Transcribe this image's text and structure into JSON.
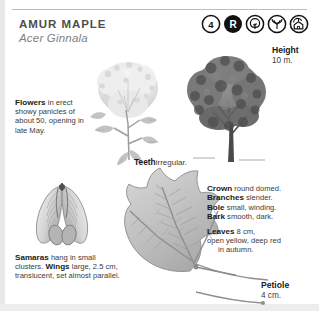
{
  "header": {
    "common_name": "AMUR MAPLE",
    "scientific_name": "Acer Ginnala"
  },
  "badges": [
    {
      "name": "zone-number-badge",
      "label": "4",
      "style": "outline"
    },
    {
      "name": "rounded-form-badge",
      "label": "R",
      "style": "solid"
    },
    {
      "name": "round-tree-icon",
      "label": "",
      "style": "outline"
    },
    {
      "name": "vase-tree-icon",
      "label": "",
      "style": "outline"
    },
    {
      "name": "tree-with-house-icon",
      "label": "",
      "style": "outline"
    }
  ],
  "callouts": {
    "height": {
      "title": "Height",
      "value": "10 m."
    },
    "teeth": {
      "title": "Teeth",
      "value": "irregular."
    },
    "petiole": {
      "title": "Petiole",
      "value": "4 cm."
    }
  },
  "flowers": {
    "title": "Flowers",
    "text": " in erect showy panicles of about 50, opening in late May."
  },
  "samaras": {
    "title": "Samaras",
    "text": " hang in small clusters.",
    "wings_title": "Wings",
    "wings_text": " large, 2.5 cm, translucent, set almost parallel."
  },
  "specs": [
    {
      "term": "Crown",
      "desc": " round domed."
    },
    {
      "term": "Branches",
      "desc": " slender."
    },
    {
      "term": "Bole",
      "desc": " small, winding."
    },
    {
      "term": "Bark",
      "desc": " smooth, dark."
    }
  ],
  "leaves": {
    "term": "Leaves",
    "desc": " 8 cm,",
    "line2": "open yellow, deep red",
    "line3": "in autumn."
  },
  "colors": {
    "rule": "#bdbdbd",
    "title_gray": "#4d4d4d",
    "subtitle_gray": "#808080",
    "body_text": "#3b3b3b",
    "tree_foliage": "#6e6e6e",
    "leaf_gray": "#b9b9b9",
    "flower_gray": "#dedede",
    "edge_gray": "#e9e9e9"
  }
}
